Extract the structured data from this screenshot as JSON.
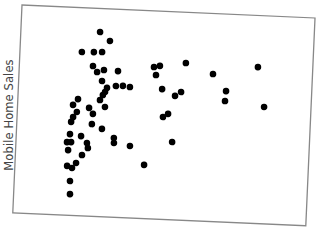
{
  "chart_data": {
    "type": "scatter",
    "title": "",
    "xlabel": "",
    "ylabel": "Mobile Home Sales",
    "xlim": [
      0,
      100
    ],
    "ylim": [
      0,
      100
    ],
    "grid": false,
    "legend": null,
    "ticks_shown": false,
    "frame_rotation_deg": 2.54,
    "marker_color": "#000000",
    "frame_color": "#888888",
    "series": [
      {
        "name": "points",
        "points": [
          [
            27.0,
            88.7
          ],
          [
            30.5,
            84.6
          ],
          [
            21.1,
            78.7
          ],
          [
            25.2,
            78.9
          ],
          [
            28.0,
            79.1
          ],
          [
            25.1,
            72.2
          ],
          [
            26.6,
            69.4
          ],
          [
            28.9,
            70.5
          ],
          [
            33.7,
            70.3
          ],
          [
            28.4,
            65.2
          ],
          [
            33.2,
            63.1
          ],
          [
            35.6,
            63.3
          ],
          [
            38.0,
            62.9
          ],
          [
            30.2,
            62.0
          ],
          [
            29.6,
            60.0
          ],
          [
            28.9,
            58.5
          ],
          [
            28.0,
            56.0
          ],
          [
            29.8,
            52.8
          ],
          [
            20.5,
            56.0
          ],
          [
            18.9,
            53.1
          ],
          [
            20.3,
            49.8
          ],
          [
            19.1,
            47.3
          ],
          [
            18.5,
            44.9
          ],
          [
            24.4,
            52.0
          ],
          [
            25.8,
            49.2
          ],
          [
            25.6,
            44.3
          ],
          [
            29.1,
            42.2
          ],
          [
            18.3,
            39.0
          ],
          [
            22.1,
            38.3
          ],
          [
            33.3,
            38.1
          ],
          [
            17.4,
            35.1
          ],
          [
            18.8,
            35.2
          ],
          [
            17.9,
            31.3
          ],
          [
            24.2,
            35.1
          ],
          [
            24.6,
            32.7
          ],
          [
            33.4,
            35.7
          ],
          [
            38.9,
            34.6
          ],
          [
            22.7,
            29.2
          ],
          [
            20.8,
            25.3
          ],
          [
            17.8,
            23.7
          ],
          [
            19.5,
            22.8
          ],
          [
            44.0,
            25.8
          ],
          [
            19.0,
            16.5
          ],
          [
            19.2,
            10.2
          ],
          [
            45.9,
            73.0
          ],
          [
            47.9,
            73.7
          ],
          [
            46.7,
            69.2
          ],
          [
            56.7,
            75.6
          ],
          [
            66.1,
            70.9
          ],
          [
            81.3,
            75.2
          ],
          [
            49.0,
            62.6
          ],
          [
            53.5,
            59.6
          ],
          [
            55.5,
            61.6
          ],
          [
            70.8,
            63.0
          ],
          [
            70.6,
            58.2
          ],
          [
            84.0,
            56.2
          ],
          [
            49.7,
            49.2
          ],
          [
            51.4,
            50.8
          ],
          [
            53.2,
            37.4
          ]
        ]
      }
    ]
  }
}
